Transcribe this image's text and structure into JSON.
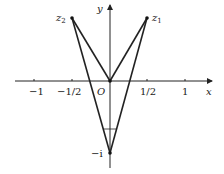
{
  "diagram": {
    "axes": {
      "x_label": "x",
      "y_label": "y",
      "origin_label": "O"
    },
    "x_ticks": [
      {
        "label": "−1",
        "x": 34
      },
      {
        "label": "−1/2",
        "x": 72
      },
      {
        "label": "1/2",
        "x": 147
      },
      {
        "label": "1",
        "x": 185
      }
    ],
    "points": {
      "z1": {
        "label": "z",
        "sub": "1",
        "value": "1/2 + i"
      },
      "z2": {
        "label": "z",
        "sub": "2",
        "value": "−1/2 + i"
      },
      "minus_i": {
        "label": "−i"
      }
    }
  }
}
